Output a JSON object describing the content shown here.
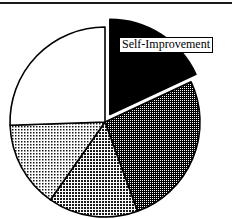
{
  "figure": {
    "width": 232,
    "height": 219,
    "background_color": "#ffffff",
    "rule_color": "#1a1a1a"
  },
  "labels": {
    "self_improvement": "Self-Improvement"
  },
  "chart_data": {
    "type": "pie",
    "title": "",
    "xlabel": "",
    "ylabel": "",
    "legend": "none",
    "grid": false,
    "start_angle_deg": 0,
    "direction": "clockwise",
    "center": [
      105,
      122
    ],
    "radius": 95,
    "annotations": [
      {
        "text": "Self-Improvement",
        "target_slice": "Self-Improvement",
        "box": true,
        "box_fill": "#ffffff",
        "box_border": "#000000"
      }
    ],
    "categories": [
      "Self-Improvement",
      "Slice 2",
      "Slice 3",
      "Slice 4",
      "Slice 5"
    ],
    "values": [
      18,
      26,
      15,
      15,
      26
    ],
    "slices": [
      {
        "label": "Self-Improvement",
        "value": 18,
        "percent": 18,
        "start_deg": 0,
        "end_deg": 65,
        "fill": "#000000",
        "pattern": "solid-black",
        "exploded": true,
        "explode_offset_px": 9,
        "outline": "#000000",
        "labeled": true
      },
      {
        "label": "Slice 2",
        "value": 26,
        "percent": 26,
        "start_deg": 65,
        "end_deg": 160,
        "fill": "#555555",
        "pattern": "dense-dark-dots",
        "exploded": false,
        "outline": "#000000",
        "labeled": false
      },
      {
        "label": "Slice 3",
        "value": 15,
        "percent": 15,
        "start_deg": 160,
        "end_deg": 215,
        "fill": "#8c8c8c",
        "pattern": "medium-gray-dots",
        "exploded": false,
        "outline": "#000000",
        "labeled": false
      },
      {
        "label": "Slice 4",
        "value": 15,
        "percent": 15,
        "start_deg": 215,
        "end_deg": 268,
        "fill": "#b0b0b0",
        "pattern": "light-gray-dots",
        "exploded": false,
        "outline": "#000000",
        "labeled": false
      },
      {
        "label": "Slice 5",
        "value": 26,
        "percent": 26,
        "start_deg": 268,
        "end_deg": 360,
        "fill": "#ffffff",
        "pattern": "plain-white",
        "exploded": false,
        "outline": "#000000",
        "labeled": false
      }
    ]
  }
}
